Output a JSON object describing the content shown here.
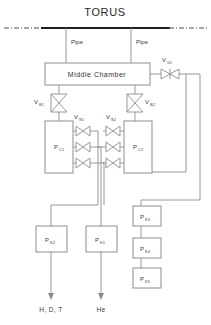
{
  "diagram": {
    "title": "TORUS",
    "pipes": [
      {
        "label": "Pipe"
      },
      {
        "label": "Pipe"
      }
    ],
    "middle_chamber": {
      "label": "Middle Chamber"
    },
    "valves": [
      {
        "id": "v53",
        "base": "V",
        "sub": "53"
      },
      {
        "id": "vb1",
        "base": "V",
        "sub": "B1"
      },
      {
        "id": "vb2",
        "base": "V",
        "sub": "B2"
      },
      {
        "id": "vs1",
        "base": "V",
        "sub": "S1"
      },
      {
        "id": "vs2",
        "base": "V",
        "sub": "S2"
      }
    ],
    "chambers": [
      {
        "id": "pc1",
        "base": "P",
        "sub": "C1"
      },
      {
        "id": "pc2",
        "base": "P",
        "sub": "C2"
      }
    ],
    "pumps": [
      {
        "id": "pk2",
        "base": "P",
        "sub": "K2"
      },
      {
        "id": "pk1",
        "base": "P",
        "sub": "K1"
      }
    ],
    "right_vessels": [
      {
        "id": "pk3",
        "base": "P",
        "sub": "K3"
      },
      {
        "id": "pk4",
        "base": "P",
        "sub": "K4"
      },
      {
        "id": "pk5",
        "base": "P",
        "sub": "K5"
      }
    ],
    "outputs": [
      {
        "id": "out-hdt",
        "label": "H, D, T"
      },
      {
        "id": "out-he",
        "label": "He"
      }
    ],
    "colors": {
      "line": "#8d8d8d",
      "torus": "#1f1f1f",
      "text": "#3a3a3a",
      "background": "#ffffff"
    }
  }
}
